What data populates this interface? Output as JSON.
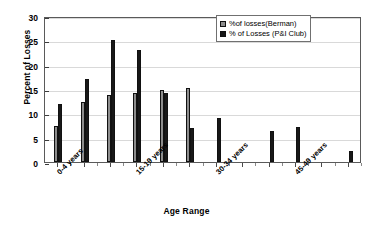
{
  "chart_data": {
    "type": "bar",
    "title": "",
    "xlabel": "Age Range",
    "ylabel": "Percent of Losses",
    "ylim": [
      0,
      30
    ],
    "ytick_values": [
      0,
      5,
      10,
      15,
      20,
      25,
      30
    ],
    "ytick_labels": [
      "0",
      "5",
      "10",
      "15",
      "20",
      "25",
      "30"
    ],
    "grid": true,
    "legend_position": "top-right",
    "categories": [
      "0-4 years",
      "5-9 years",
      "10-14 years",
      "15-19 years",
      "20-24 years",
      "25-29 years",
      "30-34 years",
      "35-39 years",
      "40-44 years",
      "45-49 years",
      "50-54 years",
      "55-59 years"
    ],
    "visible_tick_labels": [
      "0-4 years",
      "15-19 years",
      "30-34 years",
      "45-49 years"
    ],
    "visible_tick_label_indices": [
      0,
      3,
      6,
      9
    ],
    "series": [
      {
        "name": "%of losses(Berman)",
        "color": "#8d8d8d",
        "values": [
          7.3,
          12.3,
          13.8,
          14.2,
          14.7,
          15.2,
          0,
          0,
          0,
          0,
          0,
          0
        ]
      },
      {
        "name": "% of Losses (P&I Club)",
        "color": "#181818",
        "values": [
          12.0,
          17.0,
          25.0,
          23.0,
          14.1,
          7.0,
          9.0,
          0,
          6.3,
          7.1,
          0,
          2.2
        ]
      }
    ]
  },
  "legend": {
    "items": [
      {
        "label": "%of losses(Berman)"
      },
      {
        "label": "% of Losses (P&I Club)"
      }
    ]
  },
  "axes": {
    "y_title": "Percent of Losses",
    "x_title": "Age Range"
  }
}
